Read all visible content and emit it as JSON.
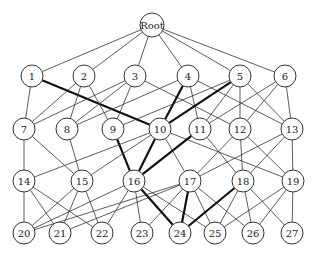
{
  "diagram": {
    "type": "layered-graph",
    "node_radius": 11,
    "nodes": [
      {
        "id": "Root",
        "label": "Root",
        "x": 152,
        "y": 25,
        "r": 12
      },
      {
        "id": "1",
        "label": "1",
        "x": 32,
        "y": 76
      },
      {
        "id": "2",
        "label": "2",
        "x": 84,
        "y": 76
      },
      {
        "id": "3",
        "label": "3",
        "x": 135,
        "y": 76
      },
      {
        "id": "4",
        "label": "4",
        "x": 188,
        "y": 76
      },
      {
        "id": "5",
        "label": "5",
        "x": 240,
        "y": 76
      },
      {
        "id": "6",
        "label": "6",
        "x": 285,
        "y": 76
      },
      {
        "id": "7",
        "label": "7",
        "x": 24,
        "y": 129
      },
      {
        "id": "8",
        "label": "8",
        "x": 67,
        "y": 129
      },
      {
        "id": "9",
        "label": "9",
        "x": 113,
        "y": 129
      },
      {
        "id": "10",
        "label": "10",
        "x": 160,
        "y": 129
      },
      {
        "id": "11",
        "label": "11",
        "x": 200,
        "y": 129
      },
      {
        "id": "12",
        "label": "12",
        "x": 240,
        "y": 129
      },
      {
        "id": "13",
        "label": "13",
        "x": 292,
        "y": 129
      },
      {
        "id": "14",
        "label": "14",
        "x": 24,
        "y": 181
      },
      {
        "id": "15",
        "label": "15",
        "x": 82,
        "y": 181
      },
      {
        "id": "16",
        "label": "16",
        "x": 134,
        "y": 181
      },
      {
        "id": "17",
        "label": "17",
        "x": 190,
        "y": 181
      },
      {
        "id": "18",
        "label": "18",
        "x": 243,
        "y": 181
      },
      {
        "id": "19",
        "label": "19",
        "x": 293,
        "y": 181
      },
      {
        "id": "20",
        "label": "20",
        "x": 24,
        "y": 233
      },
      {
        "id": "21",
        "label": "21",
        "x": 60,
        "y": 233
      },
      {
        "id": "22",
        "label": "22",
        "x": 102,
        "y": 233
      },
      {
        "id": "23",
        "label": "23",
        "x": 142,
        "y": 233
      },
      {
        "id": "24",
        "label": "24",
        "x": 180,
        "y": 233
      },
      {
        "id": "25",
        "label": "25",
        "x": 215,
        "y": 233
      },
      {
        "id": "26",
        "label": "26",
        "x": 253,
        "y": 233
      },
      {
        "id": "27",
        "label": "27",
        "x": 292,
        "y": 233
      }
    ],
    "edges": [
      {
        "from": "Root",
        "to": "1"
      },
      {
        "from": "Root",
        "to": "2"
      },
      {
        "from": "Root",
        "to": "3"
      },
      {
        "from": "Root",
        "to": "4"
      },
      {
        "from": "Root",
        "to": "5"
      },
      {
        "from": "Root",
        "to": "6"
      },
      {
        "from": "1",
        "to": "7"
      },
      {
        "from": "1",
        "to": "10",
        "bold": true
      },
      {
        "from": "2",
        "to": "7"
      },
      {
        "from": "2",
        "to": "8"
      },
      {
        "from": "2",
        "to": "9"
      },
      {
        "from": "3",
        "to": "7"
      },
      {
        "from": "3",
        "to": "8"
      },
      {
        "from": "3",
        "to": "9"
      },
      {
        "from": "3",
        "to": "12"
      },
      {
        "from": "4",
        "to": "8"
      },
      {
        "from": "4",
        "to": "10",
        "bold": true
      },
      {
        "from": "4",
        "to": "11"
      },
      {
        "from": "4",
        "to": "13"
      },
      {
        "from": "5",
        "to": "9"
      },
      {
        "from": "5",
        "to": "10",
        "bold": true
      },
      {
        "from": "5",
        "to": "11"
      },
      {
        "from": "5",
        "to": "12"
      },
      {
        "from": "5",
        "to": "13"
      },
      {
        "from": "6",
        "to": "11"
      },
      {
        "from": "6",
        "to": "12"
      },
      {
        "from": "6",
        "to": "13"
      },
      {
        "from": "7",
        "to": "14"
      },
      {
        "from": "7",
        "to": "15"
      },
      {
        "from": "8",
        "to": "15"
      },
      {
        "from": "9",
        "to": "16",
        "bold": true
      },
      {
        "from": "10",
        "to": "14"
      },
      {
        "from": "10",
        "to": "15"
      },
      {
        "from": "10",
        "to": "16",
        "bold": true
      },
      {
        "from": "10",
        "to": "17"
      },
      {
        "from": "10",
        "to": "19"
      },
      {
        "from": "11",
        "to": "16",
        "bold": true
      },
      {
        "from": "11",
        "to": "18"
      },
      {
        "from": "12",
        "to": "17"
      },
      {
        "from": "12",
        "to": "18"
      },
      {
        "from": "12",
        "to": "19"
      },
      {
        "from": "13",
        "to": "17"
      },
      {
        "from": "13",
        "to": "18"
      },
      {
        "from": "13",
        "to": "19"
      },
      {
        "from": "14",
        "to": "20"
      },
      {
        "from": "14",
        "to": "21"
      },
      {
        "from": "14",
        "to": "22"
      },
      {
        "from": "15",
        "to": "20"
      },
      {
        "from": "15",
        "to": "21"
      },
      {
        "from": "15",
        "to": "22"
      },
      {
        "from": "16",
        "to": "22"
      },
      {
        "from": "16",
        "to": "23"
      },
      {
        "from": "16",
        "to": "24",
        "bold": true
      },
      {
        "from": "16",
        "to": "20"
      },
      {
        "from": "16",
        "to": "25"
      },
      {
        "from": "17",
        "to": "20"
      },
      {
        "from": "17",
        "to": "21"
      },
      {
        "from": "17",
        "to": "23"
      },
      {
        "from": "17",
        "to": "24",
        "bold": true
      },
      {
        "from": "17",
        "to": "25"
      },
      {
        "from": "17",
        "to": "26"
      },
      {
        "from": "18",
        "to": "24",
        "bold": true
      },
      {
        "from": "18",
        "to": "25"
      },
      {
        "from": "18",
        "to": "26"
      },
      {
        "from": "18",
        "to": "27"
      },
      {
        "from": "19",
        "to": "25"
      },
      {
        "from": "19",
        "to": "26"
      },
      {
        "from": "19",
        "to": "27"
      }
    ]
  }
}
